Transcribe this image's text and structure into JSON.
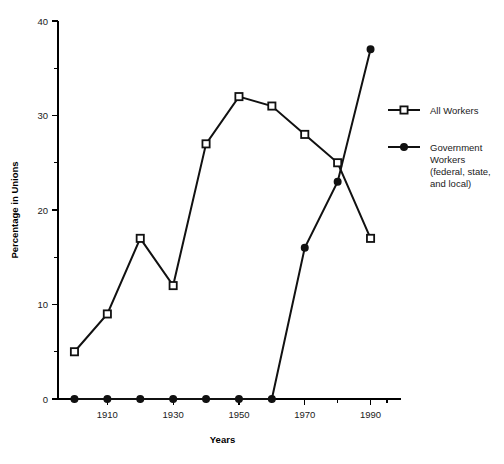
{
  "chart_data": {
    "type": "line",
    "title": "",
    "xlabel": "Years",
    "ylabel": "Percentage in Unions",
    "x": [
      1900,
      1910,
      1920,
      1930,
      1940,
      1950,
      1960,
      1970,
      1980,
      1990
    ],
    "xlim": [
      1895,
      1995
    ],
    "ylim": [
      0,
      40
    ],
    "grid": false,
    "legend_position": "right",
    "xticks_major": [
      "1910",
      "1930",
      "1950",
      "1970",
      "1990"
    ],
    "xtick_major_values": [
      1910,
      1930,
      1950,
      1970,
      1990
    ],
    "xtick_minor_values": [
      1900,
      1920,
      1940,
      1960,
      1980
    ],
    "yticks_major": [
      "0",
      "10",
      "20",
      "30",
      "40"
    ],
    "ytick_major_values": [
      0,
      10,
      20,
      30,
      40
    ],
    "ytick_minor_values": [
      5,
      15,
      25,
      35
    ],
    "series": [
      {
        "name": "All Workers",
        "marker": "open-square",
        "values": [
          5,
          9,
          17,
          12,
          27,
          32,
          31,
          28,
          25,
          17
        ]
      },
      {
        "name": "Government Workers (federal, state, and local)",
        "marker": "filled-circle",
        "values": [
          0,
          0,
          0,
          0,
          0,
          0,
          0,
          16,
          23,
          37
        ]
      }
    ]
  },
  "legend": {
    "entries": [
      {
        "label": "All Workers",
        "lines": [
          "All Workers"
        ],
        "marker": "open-square"
      },
      {
        "label": "Government Workers (federal, state, and local)",
        "lines": [
          "Government",
          "Workers",
          "(federal, state,",
          "and local)"
        ],
        "marker": "filled-circle"
      }
    ]
  },
  "colors": {
    "line": "#111111",
    "text": "#1a1a1a",
    "background": "#ffffff",
    "marker_fill": "#ffffff"
  }
}
